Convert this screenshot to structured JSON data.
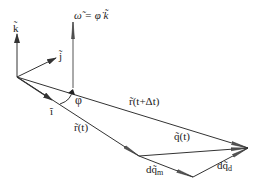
{
  "diagram": {
    "labels": {
      "k": "k̃",
      "j": "j̃",
      "i": "ĩ",
      "omega": "ω̃ = φ̇ k̃",
      "phi": "φ",
      "r_t": "r̃(t)",
      "r_t_dt": "r̃(t+Δt)",
      "q_t": "q̃(t)",
      "dq_m": "dq̃",
      "dq_m_sub": "m",
      "dq_d": "dq̃",
      "dq_d_sub": "d"
    },
    "colors": {
      "line": "#333333",
      "arrow": "#555555",
      "background": "#ffffff"
    }
  }
}
